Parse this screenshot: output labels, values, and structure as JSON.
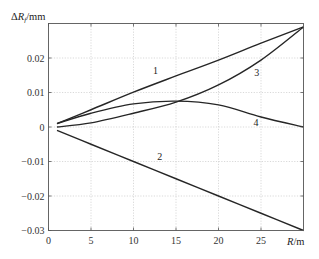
{
  "chart_data": {
    "type": "line",
    "title": "",
    "xlabel": "R/m",
    "ylabel": "ΔRf/mm",
    "ylabel_parts": {
      "delta": "Δ",
      "var": "R",
      "sub": "f",
      "unit": "/mm"
    },
    "xlabel_parts": {
      "var": "R",
      "unit": "/m"
    },
    "xlim": [
      0,
      30
    ],
    "ylim": [
      -0.03,
      0.03
    ],
    "xticks": [
      0,
      5,
      10,
      15,
      20,
      25
    ],
    "xtick_labels": [
      "0",
      "5",
      "10",
      "15",
      "20",
      "25"
    ],
    "yticks": [
      -0.03,
      -0.02,
      -0.01,
      0,
      0.01,
      0.02
    ],
    "ytick_labels": [
      "-0.03",
      "-0.02",
      "-0.01",
      "0",
      "0.01",
      "0.02"
    ],
    "grid": true,
    "legend": "none (curves labeled inline 1–4)",
    "x": [
      1,
      5,
      10,
      15,
      20,
      25,
      30
    ],
    "series": [
      {
        "name": "1",
        "values": [
          0.001,
          0.005,
          0.0101,
          0.0148,
          0.0194,
          0.0243,
          0.029
        ]
      },
      {
        "name": "2",
        "values": [
          -0.001,
          -0.005,
          -0.01,
          -0.015,
          -0.02,
          -0.025,
          -0.03
        ]
      },
      {
        "name": "3",
        "values": [
          0.0,
          0.0012,
          0.004,
          0.0072,
          0.0122,
          0.0194,
          0.029
        ]
      },
      {
        "name": "4",
        "values": [
          0.001,
          0.004,
          0.0067,
          0.0075,
          0.0064,
          0.0029,
          0.0
        ]
      }
    ],
    "annotations": [
      {
        "text": "1",
        "x": 12.6,
        "y": 0.0153
      },
      {
        "text": "2",
        "x": 13.1,
        "y": -0.0097
      },
      {
        "text": "3",
        "x": 24.5,
        "y": 0.0147
      },
      {
        "text": "4",
        "x": 24.4,
        "y": 0.0004
      }
    ]
  }
}
